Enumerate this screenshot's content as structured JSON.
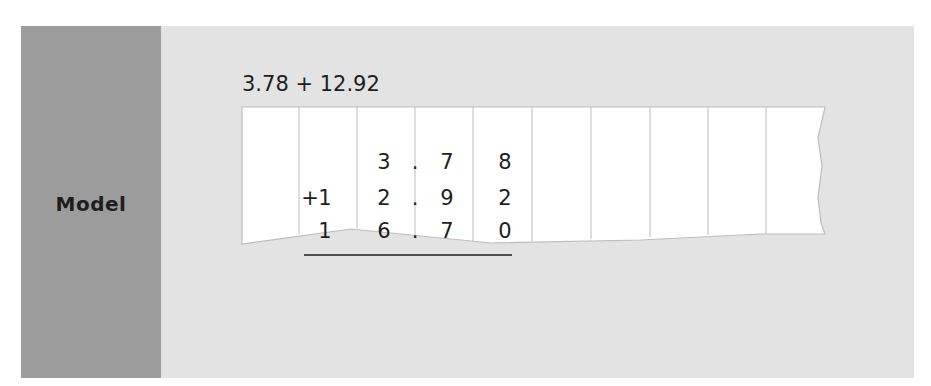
{
  "section": {
    "label": "Model",
    "expression": "3.78 + 12.92"
  },
  "place_value_chart": {
    "columns": 10,
    "rows": [
      {
        "name": "addend-1",
        "cells": [
          "",
          "",
          "3",
          ".",
          "7",
          "8"
        ]
      },
      {
        "name": "addend-2",
        "cells": [
          "+",
          "1",
          "2",
          ".",
          "9",
          "2"
        ]
      },
      {
        "name": "sum",
        "cells": [
          "",
          "1",
          "6",
          ".",
          "7",
          "0"
        ]
      }
    ]
  },
  "colors": {
    "label_background": "#9c9c9c",
    "panel_background": "#e3e3e3",
    "paper": "#ffffff",
    "grid_line": "#b8b8b8",
    "text": "#1e1e1e"
  }
}
